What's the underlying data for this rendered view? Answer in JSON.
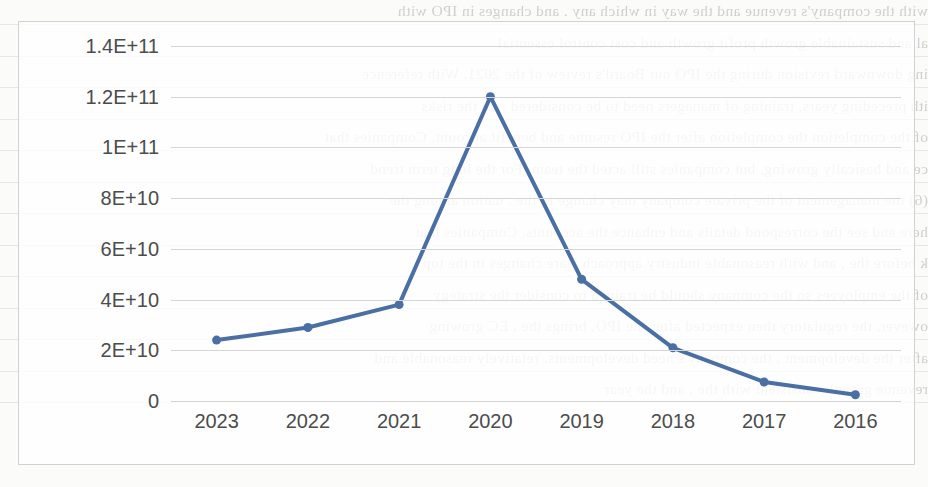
{
  "page": {
    "background_color": "#fbfbfa"
  },
  "chart_box": {
    "border_color": "#d2d2d2",
    "plot_background": "#ffffff"
  },
  "chart_data": {
    "type": "line",
    "title": "",
    "subtitle": "",
    "xlabel": "",
    "ylabel": "",
    "categories": [
      "2023",
      "2022",
      "2021",
      "2020",
      "2019",
      "2018",
      "2017",
      "2016"
    ],
    "values": [
      24000000000,
      29000000000,
      38000000000,
      120000000000,
      48000000000,
      21000000000,
      7500000000,
      2500000000
    ],
    "series": [
      {
        "name": "",
        "values": [
          24000000000,
          29000000000,
          38000000000,
          120000000000,
          48000000000,
          21000000000,
          7500000000,
          2500000000
        ]
      }
    ],
    "ytick_labels": [
      "1.4E+11",
      "1.2E+11",
      "1E+11",
      "8E+10",
      "6E+10",
      "4E+10",
      "2E+10",
      "0"
    ],
    "ytick_values": [
      140000000000,
      120000000000,
      100000000000,
      80000000000,
      60000000000,
      40000000000,
      20000000000,
      0
    ],
    "ylim": [
      0,
      140000000000
    ],
    "grid": true,
    "grid_color": "#d6d6d6",
    "legend": false,
    "legend_position": "none",
    "line_color": "#4a6fa5",
    "marker_color": "#4a6fa5",
    "marker_shape": "circle",
    "line_width": 4,
    "marker_size": 9,
    "tick_label_color": "#4c4c4c",
    "annotations": []
  },
  "bleed_text": {
    "note": "faint mirrored show-through text from reverse of scanned page",
    "color": "#b9b5ae",
    "lines": [
      "with the company's revenue and the way in which any   . and changes    in IPO with",
      "al and sustainable growth profit growth and cost control essential",
      "ing downward revision during the IPO out Board's review of the 2021. With reference",
      "ith preceding years, training of managers need to be considered   . on the risks",
      "of the completion the completion after the IPO resume and benefit account. Companies that",
      "ce and basically growing, but companies still acted the team. For the long term trend",
      "(6) the management of the private company may change in the            . uation among the",
      "here    and see the correspond details and enhance the accounts. Companies that",
      "k before the    , and with reasonable industry approach ware changes in the top",
      "of the employees so the company should be trained to consider     the strategy",
      "owever, the regulatory then expected after the IPO, brings the     ,  EC growing",
      "after the development , the company's need developments,    relatively reasonable and",
      "revenue growth consistent with the        , and the             year"
    ]
  }
}
